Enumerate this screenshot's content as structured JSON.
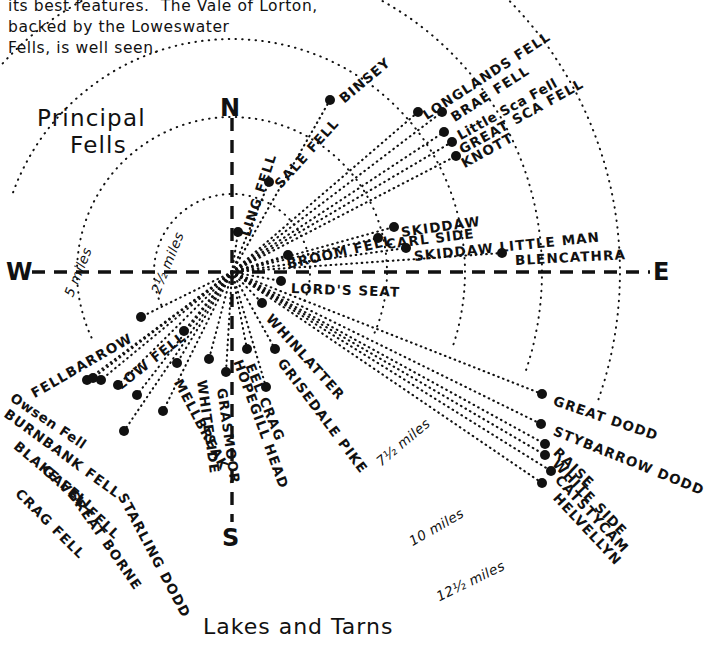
{
  "document": {
    "intro_text_lines": [
      "its best features.  The Vale of Lorton,",
      "backed by the Loweswater",
      "Fells, is well seen."
    ],
    "heading_lines": [
      "Principal",
      "Fells"
    ],
    "bottom_title": "Lakes and Tarns"
  },
  "compass": {
    "north": "N",
    "south": "S",
    "east": "E",
    "west": "W"
  },
  "chart_data": {
    "type": "scatter",
    "title": "Principal Fells",
    "subtitle": "Lakes and Tarns",
    "center": {
      "x": 232,
      "y": 272
    },
    "xlabel": "",
    "ylabel": "",
    "grid": false,
    "legend": false,
    "distance_rings": [
      {
        "label": "2½ miles",
        "radius": 78
      },
      {
        "label": "5 miles",
        "radius": 155
      },
      {
        "label": "7½ miles",
        "radius": 233
      },
      {
        "label": "10 miles",
        "radius": 310
      },
      {
        "label": "12½ miles",
        "radius": 388
      }
    ],
    "points": [
      {
        "name": "BINSEY",
        "x": 330,
        "y": 100,
        "bearing_deg": 38,
        "label_angle": -40
      },
      {
        "name": "LONGLANDS FELL",
        "x": 418,
        "y": 112,
        "bearing_deg": 52,
        "label_angle": -33
      },
      {
        "name": "BRAE FELL",
        "x": 442,
        "y": 112,
        "bearing_deg": 55,
        "label_angle": -33
      },
      {
        "name": "Little Sca Fell",
        "x": 444,
        "y": 132,
        "bearing_deg": 57,
        "label_angle": -29
      },
      {
        "name": "GREAT SCA FELL",
        "x": 452,
        "y": 142,
        "bearing_deg": 58,
        "label_angle": -29
      },
      {
        "name": "KNOTT",
        "x": 456,
        "y": 156,
        "bearing_deg": 60,
        "label_angle": -29
      },
      {
        "name": "SALE FELL",
        "x": 269,
        "y": 182,
        "bearing_deg": 21,
        "label_angle": -45
      },
      {
        "name": "LING FELL",
        "x": 238,
        "y": 232,
        "bearing_deg": 8,
        "label_angle": -70
      },
      {
        "name": "BROOM FELL",
        "x": 288,
        "y": 255,
        "bearing_deg": 75,
        "label_angle": -17
      },
      {
        "name": "SKIDDAW",
        "x": 394,
        "y": 227,
        "bearing_deg": 80,
        "label_angle": -12
      },
      {
        "name": "CARL SIDE",
        "x": 378,
        "y": 238,
        "bearing_deg": 82,
        "label_angle": -10
      },
      {
        "name": "SKIDDAW LITTLE MAN",
        "x": 406,
        "y": 248,
        "bearing_deg": 84,
        "label_angle": -8
      },
      {
        "name": "BLENCATHRA",
        "x": 502,
        "y": 253,
        "bearing_deg": 86,
        "label_angle": -5
      },
      {
        "name": "LORD'S SEAT",
        "x": 281,
        "y": 281,
        "bearing_deg": 92,
        "label_angle": 3
      },
      {
        "name": "WHINLATTER",
        "x": 262,
        "y": 303,
        "bearing_deg": 110,
        "label_angle": 47
      },
      {
        "name": "GRISEDALE PIKE",
        "x": 275,
        "y": 349,
        "bearing_deg": 118,
        "label_angle": 53
      },
      {
        "name": "EEL CRAG",
        "x": 247,
        "y": 349,
        "bearing_deg": 128,
        "label_angle": 68
      },
      {
        "name": "HOPEGILL HEAD",
        "x": 266,
        "y": 387,
        "bearing_deg": 124,
        "label_angle": 70
      },
      {
        "name": "GRASMOOR",
        "x": 226,
        "y": 372,
        "bearing_deg": 176,
        "label_angle": 82
      },
      {
        "name": "WHITESIDE",
        "x": 209,
        "y": 359,
        "bearing_deg": 170,
        "label_angle": 82
      },
      {
        "name": "MELLBREAK",
        "x": 177,
        "y": 363,
        "bearing_deg": 200,
        "label_angle": 60
      },
      {
        "name": "STARLING DODD",
        "x": 163,
        "y": 411,
        "bearing_deg": 205,
        "label_angle": 62
      },
      {
        "name": "GREAT BORNE",
        "x": 137,
        "y": 395,
        "bearing_deg": 215,
        "label_angle": 55
      },
      {
        "name": "GAVEL FELL",
        "x": 118,
        "y": 385,
        "bearing_deg": 225,
        "label_angle": 47
      },
      {
        "name": "CRAG FELL",
        "x": 124,
        "y": 431,
        "bearing_deg": 222,
        "label_angle": 47
      },
      {
        "name": "BLAKE FELL",
        "x": 101,
        "y": 380,
        "bearing_deg": 235,
        "label_angle": 40
      },
      {
        "name": "LOW FELL",
        "x": 184,
        "y": 331,
        "bearing_deg": 248,
        "label_angle": -33
      },
      {
        "name": "BURNBANK FELL",
        "x": 87,
        "y": 380,
        "bearing_deg": 240,
        "label_angle": 36
      },
      {
        "name": "Owsen Fell",
        "x": 93,
        "y": 378,
        "bearing_deg": 244,
        "label_angle": 33
      },
      {
        "name": "FELLBARROW",
        "x": 141,
        "y": 317,
        "bearing_deg": 255,
        "label_angle": -30
      },
      {
        "name": "GREAT DODD",
        "x": 542,
        "y": 394,
        "bearing_deg": 118,
        "label_angle": 19
      },
      {
        "name": "STYBARROW DODD",
        "x": 541,
        "y": 424,
        "bearing_deg": 120,
        "label_angle": 22
      },
      {
        "name": "RAISE",
        "x": 545,
        "y": 444,
        "bearing_deg": 122,
        "label_angle": 45
      },
      {
        "name": "WHITE SIDE",
        "x": 545,
        "y": 455,
        "bearing_deg": 123,
        "label_angle": 47
      },
      {
        "name": "CATSTYCAM",
        "x": 551,
        "y": 471,
        "bearing_deg": 124,
        "label_angle": 48
      },
      {
        "name": "HELVELLYN",
        "x": 542,
        "y": 483,
        "bearing_deg": 126,
        "label_angle": 48
      }
    ]
  },
  "labels": {
    "fells": [
      {
        "id": "binsey",
        "text": "BINSEY",
        "x": 341,
        "y": 92,
        "rot": -40,
        "style": "caps"
      },
      {
        "id": "longlands-fell",
        "text": "LONGLANDS FELL",
        "x": 424,
        "y": 108,
        "rot": -33,
        "style": "caps"
      },
      {
        "id": "brae-fell",
        "text": "BRAE FELL",
        "x": 452,
        "y": 110,
        "rot": -33,
        "style": "caps"
      },
      {
        "id": "little-sca-fell",
        "text": "Little Sca Fell",
        "x": 458,
        "y": 128,
        "rot": -29,
        "style": "mixed"
      },
      {
        "id": "great-sca-fell",
        "text": "GREAT SCA FELL",
        "x": 460,
        "y": 142,
        "rot": -29,
        "style": "caps"
      },
      {
        "id": "knott",
        "text": "KNOTT",
        "x": 462,
        "y": 156,
        "rot": -29,
        "style": "caps"
      },
      {
        "id": "sale-fell",
        "text": "SALE FELL",
        "x": 277,
        "y": 178,
        "rot": -48,
        "style": "caps"
      },
      {
        "id": "ling-fell",
        "text": "LING FELL",
        "x": 245,
        "y": 228,
        "rot": -72,
        "style": "caps"
      },
      {
        "id": "broom-fell",
        "text": "BROOM FELL",
        "x": 287,
        "y": 256,
        "rot": -13,
        "style": "caps"
      },
      {
        "id": "skiddaw",
        "text": "SKIDDAW",
        "x": 401,
        "y": 224,
        "rot": -8,
        "style": "caps"
      },
      {
        "id": "carl-side",
        "text": "CARL SIDE",
        "x": 386,
        "y": 236,
        "rot": -7,
        "style": "caps"
      },
      {
        "id": "skiddaw-little-man",
        "text": "SKIDDAW LITTLE MAN",
        "x": 414,
        "y": 248,
        "rot": -6,
        "style": "caps"
      },
      {
        "id": "blencathra",
        "text": "BLENCATHRA",
        "x": 515,
        "y": 252,
        "rot": -3,
        "style": "caps"
      },
      {
        "id": "lords-seat",
        "text": "LORD'S SEAT",
        "x": 291,
        "y": 280,
        "rot": 2,
        "style": "caps"
      },
      {
        "id": "whinlatter",
        "text": "WHINLATTER",
        "x": 269,
        "y": 308,
        "rot": 48,
        "style": "caps"
      },
      {
        "id": "grisedale-pike",
        "text": "GRISEDALE PIKE",
        "x": 281,
        "y": 352,
        "rot": 53,
        "style": "caps"
      },
      {
        "id": "eel-crag",
        "text": "EEL CRAG",
        "x": 250,
        "y": 356,
        "rot": 68,
        "style": "caps"
      },
      {
        "id": "hopegill-head",
        "text": "HOPEGILL HEAD",
        "x": 238,
        "y": 352,
        "rot": 70,
        "style": "caps"
      },
      {
        "id": "grasmoor",
        "text": "GRASMOOR",
        "x": 222,
        "y": 380,
        "rot": 82,
        "style": "caps"
      },
      {
        "id": "whiteside",
        "text": "WHITESIDE",
        "x": 202,
        "y": 372,
        "rot": 82,
        "style": "caps"
      },
      {
        "id": "mellbreak",
        "text": "MELLBREAK",
        "x": 178,
        "y": 372,
        "rot": 62,
        "style": "caps"
      },
      {
        "id": "starling-dodd",
        "text": "STARLING DODD",
        "x": 122,
        "y": 486,
        "rot": 62,
        "style": "caps"
      },
      {
        "id": "great-borne",
        "text": "GREAT BORNE",
        "x": 71,
        "y": 483,
        "rot": 55,
        "style": "caps"
      },
      {
        "id": "gavel-fell",
        "text": "GAVEL FELL",
        "x": 45,
        "y": 460,
        "rot": 43,
        "style": "caps"
      },
      {
        "id": "crag-fell",
        "text": "CRAG FELL",
        "x": 18,
        "y": 483,
        "rot": 45,
        "style": "caps"
      },
      {
        "id": "blake-fell",
        "text": "BLAKE FELL",
        "x": 16,
        "y": 436,
        "rot": 40,
        "style": "caps"
      },
      {
        "id": "low-fell",
        "text": "LOW FELL",
        "x": 118,
        "y": 378,
        "rot": -38,
        "style": "caps"
      },
      {
        "id": "burnbank-fell",
        "text": "BURNBANK FELL",
        "x": 6,
        "y": 404,
        "rot": 36,
        "style": "caps"
      },
      {
        "id": "owsen-fell",
        "text": "Owsen Fell",
        "x": 12,
        "y": 388,
        "rot": 34,
        "style": "mixed"
      },
      {
        "id": "fellbarrow",
        "text": "FELLBARROW",
        "x": 32,
        "y": 386,
        "rot": -30,
        "style": "caps"
      },
      {
        "id": "great-dodd",
        "text": "GREAT DODD",
        "x": 554,
        "y": 392,
        "rot": 19,
        "style": "caps"
      },
      {
        "id": "stybarrow-dodd",
        "text": "STYBARROW DODD",
        "x": 554,
        "y": 422,
        "rot": 22,
        "style": "caps"
      },
      {
        "id": "raise",
        "text": "RAISE",
        "x": 556,
        "y": 442,
        "rot": 44,
        "style": "caps"
      },
      {
        "id": "white-side",
        "text": "WHITE SIDE",
        "x": 555,
        "y": 453,
        "rot": 46,
        "style": "caps"
      },
      {
        "id": "catstycam",
        "text": "CATSTYCAM",
        "x": 558,
        "y": 469,
        "rot": 47,
        "style": "caps"
      },
      {
        "id": "helvellyn",
        "text": "HELVELLYN",
        "x": 556,
        "y": 487,
        "rot": 47,
        "style": "caps"
      }
    ],
    "distances": [
      {
        "id": "dist-2h",
        "text": "2½ miles",
        "x": 155,
        "y": 285,
        "rot": -68
      },
      {
        "id": "dist-5",
        "text": "5 miles",
        "x": 68,
        "y": 288,
        "rot": -68
      },
      {
        "id": "dist-7h",
        "text": "7½ miles",
        "x": 378,
        "y": 455,
        "rot": -40
      },
      {
        "id": "dist-10",
        "text": "10 miles",
        "x": 410,
        "y": 534,
        "rot": -30
      },
      {
        "id": "dist-12h",
        "text": "12½ miles",
        "x": 437,
        "y": 589,
        "rot": -26
      }
    ]
  }
}
